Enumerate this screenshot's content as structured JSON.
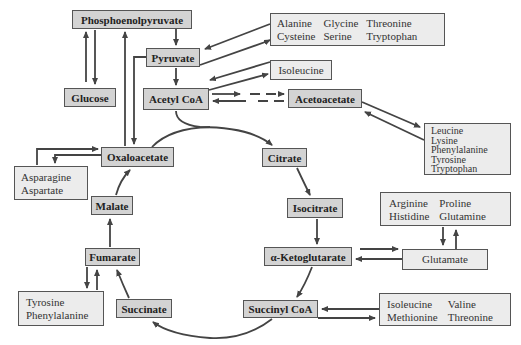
{
  "metabolites": {
    "pep": "Phosphoenolpyruvate",
    "pyruvate": "Pyruvate",
    "glucose": "Glucose",
    "acetyl_coa": "Acetyl CoA",
    "acetoacetate": "Acetoacetate",
    "oxaloacetate": "Oxaloacetate",
    "citrate": "Citrate",
    "isocitrate": "Isocitrate",
    "malate": "Malate",
    "alpha_kg": "α-Ketoglutarate",
    "fumarate": "Fumarate",
    "succinate": "Succinate",
    "succinyl_coa": "Succinyl CoA"
  },
  "amino_acid_groups": {
    "to_pyruvate": [
      "Alanine",
      "Glycine",
      "Threonine",
      "Cysteine",
      "Serine",
      "Tryptophan"
    ],
    "to_acetyl_coa": [
      "Isoleucine"
    ],
    "to_acetoacetate": [
      "Leucine",
      "Lysine",
      "Phenylalanine",
      "Tyrosine",
      "Tryptophan"
    ],
    "to_oxaloacetate": [
      "Asparagine",
      "Aspartate"
    ],
    "to_glutamate": [
      "Arginine",
      "Proline",
      "Histidine",
      "Glutamine"
    ],
    "glutamate": "Glutamate",
    "to_fumarate": [
      "Tyrosine",
      "Phenylalanine"
    ],
    "to_succinyl_coa": [
      "Isoleucine",
      "Valine",
      "Methionine",
      "Threonine"
    ]
  }
}
